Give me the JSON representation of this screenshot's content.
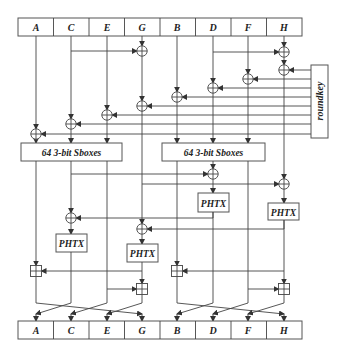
{
  "diagram": {
    "type": "block-cipher-round-function",
    "input_registers": [
      "A",
      "C",
      "E",
      "G",
      "B",
      "D",
      "F",
      "H"
    ],
    "output_registers": [
      "A",
      "C",
      "E",
      "G",
      "B",
      "D",
      "F",
      "H"
    ],
    "roundkey_label": "roundkey",
    "sbox_left_label": "64 3-bit Sboxes",
    "sbox_right_label": "64 3-bit Sboxes",
    "phtx_labels": [
      "PHTX",
      "PHTX",
      "PHTX",
      "PHTX"
    ],
    "operations": {
      "xor_symbol": "⊕",
      "modadd_symbol": "⊞"
    },
    "colors": {
      "line": "#444444",
      "box_border": "#555555",
      "background": "#ffffff"
    }
  }
}
